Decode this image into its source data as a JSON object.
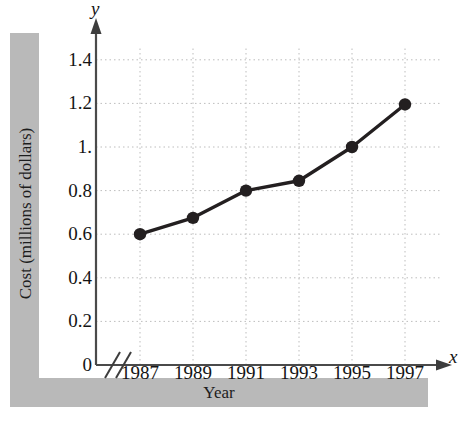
{
  "figure": {
    "y_axis_band_label": "Cost (millions of dollars)",
    "x_axis_band_label": "Year",
    "y_axis_letter": "y",
    "x_axis_letter": "x",
    "band_color": "#b9b9b9",
    "line_color": "#231f20",
    "marker_color": "#231f20",
    "grid_color": "#bdbdbd"
  },
  "chart_data": {
    "type": "line",
    "title": "",
    "xlabel": "Year",
    "ylabel": "Cost (millions of dollars)",
    "categories": [
      "1987",
      "1989",
      "1991",
      "1993",
      "1995",
      "1997"
    ],
    "x": [
      1987,
      1989,
      1991,
      1993,
      1995,
      1997
    ],
    "values": [
      0.6,
      0.675,
      0.8,
      0.845,
      1.0,
      1.195
    ],
    "ylim": [
      0,
      1.5
    ],
    "yticks": [
      0,
      0.2,
      0.4,
      0.6,
      0.8,
      1.0,
      1.2,
      1.4
    ],
    "ytick_labels": [
      "0",
      "0.2",
      "0.4",
      "0.6",
      "0.8",
      "1.",
      "1.2",
      "1.4"
    ],
    "xtick_labels": [
      "1987",
      "1989",
      "1991",
      "1993",
      "1995",
      "1997"
    ],
    "grid": true,
    "grid_style": "dotted",
    "legend": "none",
    "axis_break": "x-axis break between origin and 1987",
    "markers": "filled-circle"
  }
}
